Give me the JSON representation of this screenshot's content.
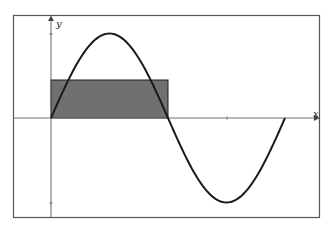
{
  "diagram": {
    "type": "function-plot",
    "axes": {
      "x_label": "x",
      "y_label": "y"
    },
    "curve": {
      "function": "sin",
      "period_range": [
        0,
        "2π"
      ],
      "color": "#1a1a1a"
    },
    "shaded_rectangle": {
      "x_from": 0,
      "x_to": "π",
      "height_fraction_of_amplitude": 0.45,
      "fill": "#707070",
      "stroke": "#1a1a1a"
    },
    "colors": {
      "frame": "#555555",
      "axis": "#666666",
      "background": "#ffffff"
    }
  }
}
